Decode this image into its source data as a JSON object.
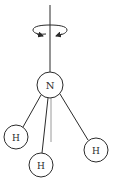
{
  "diagram": {
    "atoms": [
      {
        "id": "n",
        "label": "N",
        "cx": 50,
        "cy": 85,
        "r": 13
      },
      {
        "id": "h1",
        "label": "H",
        "cx": 16,
        "cy": 137,
        "r": 12
      },
      {
        "id": "h2",
        "label": "H",
        "cx": 41,
        "cy": 165,
        "r": 12
      },
      {
        "id": "h3",
        "label": "H",
        "cx": 96,
        "cy": 150,
        "r": 12
      }
    ],
    "axis": {
      "x": 50,
      "y_top": 5,
      "y_bottom": 72
    },
    "axis_extension": {
      "x1": 50,
      "y1": 98,
      "x2": 51,
      "y2": 142
    },
    "rotation_arrow": {
      "cx": 50,
      "cy": 30,
      "rx": 17,
      "ry": 5
    },
    "colors": {
      "stroke": "#2b2b2b",
      "axis_extension": "#9a9a9a",
      "background": "#ffffff"
    }
  }
}
